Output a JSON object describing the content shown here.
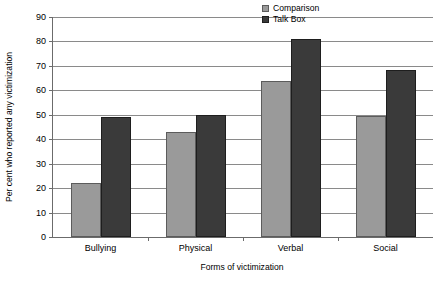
{
  "chart_data": {
    "type": "bar",
    "title": "",
    "subtitle": "",
    "xlabel": "Forms of victimization",
    "ylabel": "Per cent who reported any victimization",
    "categories": [
      "Bullying",
      "Physical",
      "Verbal",
      "Social"
    ],
    "series": [
      {
        "name": "Comparison",
        "color": "#9a9a9a",
        "values": [
          22,
          43,
          64,
          49.5
        ]
      },
      {
        "name": "Talk Box",
        "color": "#3a3a3a",
        "values": [
          49,
          50,
          81,
          68.5
        ]
      }
    ],
    "ylim": [
      0,
      90
    ],
    "ytick_step": 10,
    "ytick_labels": [
      "0",
      "10",
      "20",
      "30",
      "40",
      "50",
      "60",
      "70",
      "80",
      "90"
    ],
    "grid": "horizontal",
    "legend_position": "top-right-inside",
    "axis_color": "#6b6b6b",
    "grid_color": "#8a8a8a",
    "background": "#ffffff"
  }
}
